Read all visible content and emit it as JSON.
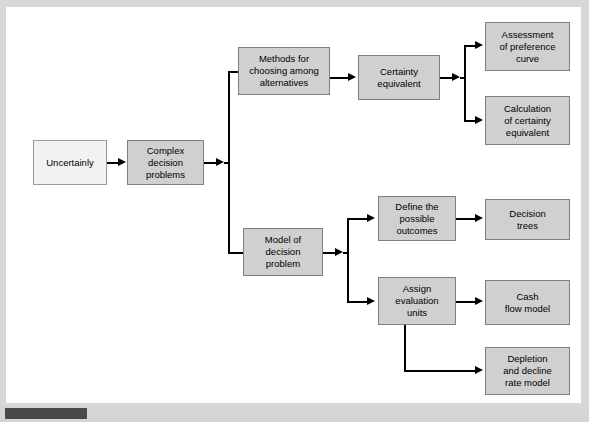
{
  "figure": {
    "type": "flowchart",
    "orientation": "left-to-right",
    "colors": {
      "node_fill": "#d0d0d0",
      "node_fill_light": "#f2f2f2",
      "node_border": "#808080",
      "connector": "#000000",
      "page_background": "#ffffff",
      "scan_border": "#d8d8d8",
      "bottom_marker": "#4a4a4a"
    }
  },
  "nodes": [
    {
      "id": "uncertainly",
      "label": "Uncertainly",
      "x": 33,
      "y": 140,
      "w": 74,
      "h": 45,
      "style": "light"
    },
    {
      "id": "complex-problems",
      "label": "Complex\ndecision\nproblems",
      "x": 127,
      "y": 140,
      "w": 77,
      "h": 45,
      "style": "filled"
    },
    {
      "id": "methods",
      "label": "Methods for\nchoosing among\nalternatives",
      "x": 238,
      "y": 47,
      "w": 92,
      "h": 48,
      "style": "filled"
    },
    {
      "id": "certainty-equiv",
      "label": "Certainty\nequivalent",
      "x": 358,
      "y": 55,
      "w": 82,
      "h": 45,
      "style": "filled"
    },
    {
      "id": "assessment",
      "label": "Assessment\nof preference\ncurve",
      "x": 485,
      "y": 22,
      "w": 85,
      "h": 49,
      "style": "filled"
    },
    {
      "id": "calculation",
      "label": "Calculation\nof certainty\nequivalent",
      "x": 485,
      "y": 96,
      "w": 85,
      "h": 49,
      "style": "filled"
    },
    {
      "id": "model",
      "label": "Model of\ndecision\nproblem",
      "x": 243,
      "y": 228,
      "w": 80,
      "h": 48,
      "style": "filled"
    },
    {
      "id": "define-outcomes",
      "label": "Define the\npossible\noutcomes",
      "x": 378,
      "y": 196,
      "w": 78,
      "h": 45,
      "style": "filled"
    },
    {
      "id": "assign-units",
      "label": "Assign\nevaluation\nunits",
      "x": 378,
      "y": 277,
      "w": 78,
      "h": 48,
      "style": "filled"
    },
    {
      "id": "decision-trees",
      "label": "Decision\ntrees",
      "x": 485,
      "y": 199,
      "w": 85,
      "h": 41,
      "style": "filled"
    },
    {
      "id": "cash-flow",
      "label": "Cash\nflow model",
      "x": 485,
      "y": 280,
      "w": 85,
      "h": 45,
      "style": "filled"
    },
    {
      "id": "depletion",
      "label": "Depletion\nand decline\nrate model",
      "x": 485,
      "y": 347,
      "w": 85,
      "h": 48,
      "style": "filled"
    }
  ],
  "edges": [
    {
      "from": "uncertainly",
      "to": "complex-problems"
    },
    {
      "from": "complex-problems",
      "to": "methods"
    },
    {
      "from": "complex-problems",
      "to": "model"
    },
    {
      "from": "methods",
      "to": "certainty-equiv"
    },
    {
      "from": "certainty-equiv",
      "to": "assessment"
    },
    {
      "from": "certainty-equiv",
      "to": "calculation"
    },
    {
      "from": "model",
      "to": "define-outcomes"
    },
    {
      "from": "model",
      "to": "assign-units"
    },
    {
      "from": "define-outcomes",
      "to": "decision-trees"
    },
    {
      "from": "assign-units",
      "to": "cash-flow"
    },
    {
      "from": "assign-units",
      "to": "depletion"
    }
  ]
}
